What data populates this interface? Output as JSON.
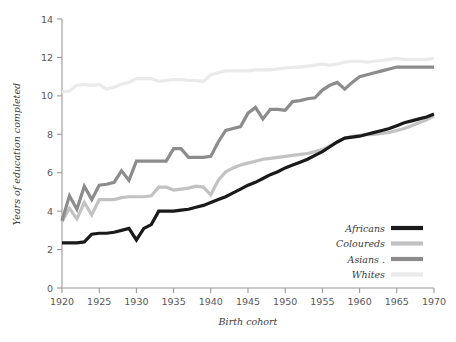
{
  "chart_data": {
    "type": "line",
    "title": "",
    "xlabel": "Birth cohort",
    "ylabel": "Years of education completed",
    "xlim": [
      1920,
      1970
    ],
    "ylim": [
      0,
      14
    ],
    "xticks": [
      1920,
      1925,
      1930,
      1935,
      1940,
      1945,
      1950,
      1955,
      1960,
      1965,
      1970
    ],
    "yticks": [
      0,
      2,
      4,
      6,
      8,
      10,
      12,
      14
    ],
    "grid": false,
    "legend_position": "bottom-right",
    "x": [
      1920,
      1921,
      1922,
      1923,
      1924,
      1925,
      1926,
      1927,
      1928,
      1929,
      1930,
      1931,
      1932,
      1933,
      1934,
      1935,
      1936,
      1937,
      1938,
      1939,
      1940,
      1941,
      1942,
      1943,
      1944,
      1945,
      1946,
      1947,
      1948,
      1949,
      1950,
      1951,
      1952,
      1953,
      1954,
      1955,
      1956,
      1957,
      1958,
      1959,
      1960,
      1961,
      1962,
      1963,
      1964,
      1965,
      1966,
      1967,
      1968,
      1969,
      1970
    ],
    "series": [
      {
        "name": "Africans",
        "color": "#1a1a1a",
        "width": 3.2,
        "values": [
          2.35,
          2.35,
          2.35,
          2.4,
          2.8,
          2.85,
          2.85,
          2.9,
          3.0,
          3.1,
          2.5,
          3.1,
          3.3,
          4.0,
          4.0,
          4.0,
          4.05,
          4.1,
          4.2,
          4.3,
          4.45,
          4.6,
          4.75,
          4.95,
          5.15,
          5.35,
          5.5,
          5.7,
          5.9,
          6.05,
          6.25,
          6.4,
          6.55,
          6.7,
          6.9,
          7.1,
          7.35,
          7.6,
          7.8,
          7.85,
          7.9,
          8.0,
          8.1,
          8.2,
          8.3,
          8.45,
          8.6,
          8.7,
          8.8,
          8.9,
          9.05
        ]
      },
      {
        "name": "Coloureds",
        "color": "#c2c2c2",
        "width": 3.2,
        "values": [
          3.45,
          4.15,
          3.6,
          4.45,
          3.8,
          4.6,
          4.6,
          4.6,
          4.7,
          4.75,
          4.75,
          4.75,
          4.8,
          5.25,
          5.25,
          5.1,
          5.15,
          5.2,
          5.3,
          5.25,
          4.85,
          5.6,
          6.05,
          6.25,
          6.4,
          6.5,
          6.6,
          6.7,
          6.75,
          6.8,
          6.85,
          6.9,
          6.95,
          7.0,
          7.1,
          7.2,
          7.4,
          7.6,
          7.8,
          7.9,
          7.95,
          7.98,
          8.0,
          8.05,
          8.1,
          8.2,
          8.3,
          8.45,
          8.6,
          8.75,
          8.95
        ]
      },
      {
        "name": "Asians",
        "color": "#8c8c8c",
        "width": 3.2,
        "values": [
          3.5,
          4.8,
          4.1,
          5.3,
          4.6,
          5.35,
          5.4,
          5.5,
          6.1,
          5.6,
          6.6,
          6.6,
          6.6,
          6.6,
          6.6,
          7.25,
          7.25,
          6.8,
          6.8,
          6.8,
          6.85,
          7.6,
          8.2,
          8.3,
          8.4,
          9.1,
          9.4,
          8.8,
          9.3,
          9.3,
          9.25,
          9.7,
          9.75,
          9.85,
          9.9,
          10.3,
          10.55,
          10.7,
          10.35,
          10.7,
          11.0,
          11.1,
          11.2,
          11.3,
          11.4,
          11.5,
          11.5,
          11.5,
          11.5,
          11.5,
          11.5
        ]
      },
      {
        "name": "Whites",
        "color": "#eaeaea",
        "width": 3.2,
        "values": [
          10.2,
          10.25,
          10.55,
          10.6,
          10.55,
          10.6,
          10.35,
          10.45,
          10.6,
          10.7,
          10.9,
          10.9,
          10.9,
          10.75,
          10.8,
          10.85,
          10.85,
          10.8,
          10.8,
          10.75,
          11.1,
          11.2,
          11.3,
          11.3,
          11.3,
          11.3,
          11.35,
          11.35,
          11.35,
          11.4,
          11.45,
          11.5,
          11.5,
          11.55,
          11.6,
          11.65,
          11.6,
          11.65,
          11.75,
          11.8,
          11.8,
          11.75,
          11.8,
          11.85,
          11.9,
          11.95,
          11.9,
          11.9,
          11.9,
          11.9,
          11.95
        ]
      }
    ]
  },
  "legend": {
    "items": [
      {
        "label": "Africans",
        "color": "#1a1a1a"
      },
      {
        "label": "Coloureds",
        "color": "#c2c2c2"
      },
      {
        "label": "Asians .",
        "color": "#8c8c8c"
      },
      {
        "label": "Whites",
        "color": "#eaeaea"
      }
    ]
  }
}
